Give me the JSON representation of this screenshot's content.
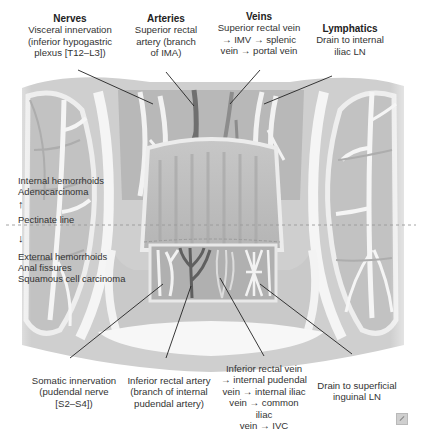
{
  "top_labels": [
    {
      "id": "nerves",
      "title": "Nerves",
      "lines": [
        "Visceral innervation",
        "(inferior hypogastric",
        "plexus [T12–L3])"
      ]
    },
    {
      "id": "arteries",
      "title": "Arteries",
      "lines": [
        "Superior rectal",
        "artery (branch",
        "of IMA)"
      ]
    },
    {
      "id": "veins",
      "title": "Veins",
      "lines": [
        "Superior rectal vein",
        "→ IMV  → splenic",
        "vein → portal vein"
      ]
    },
    {
      "id": "lymphatics",
      "title": "Lymphatics",
      "lines": [
        "Drain to internal",
        "iliac LN"
      ]
    }
  ],
  "side_labels": {
    "above": [
      "Internal hemorrhoids",
      "Adenocarcinoma"
    ],
    "arrow_up": "↑",
    "pectinate": "Pectinate line",
    "arrow_down": "↓",
    "below": [
      "External hemorrhoids",
      "Anal fissures",
      "Squamous cell carcinoma"
    ]
  },
  "bottom_labels": [
    {
      "id": "somatic",
      "lines": [
        "Somatic innervation",
        "(pudendal nerve",
        "[S2–S4])"
      ]
    },
    {
      "id": "inf-artery",
      "lines": [
        "Inferior rectal artery",
        "(branch of internal",
        "pudendal artery)"
      ]
    },
    {
      "id": "inf-vein",
      "lines": [
        "Inferior rectal vein",
        "→ internal pudendal",
        "vein → internal iliac",
        "vein → common iliac",
        "vein → IVC"
      ]
    },
    {
      "id": "inf-lymph",
      "lines": [
        "Drain to superficial",
        "inguinal LN"
      ]
    }
  ],
  "colors": {
    "tissue_light": "#d6d6d6",
    "tissue_mid": "#bdbdbd",
    "tissue_dark": "#9e9e9e",
    "vessel_white": "#f4f4f4",
    "vein_dark": "#6f6f6f",
    "leader": "#222222",
    "pectinate_dash": "#9a9a9a"
  },
  "corner_icon": "expand-icon"
}
